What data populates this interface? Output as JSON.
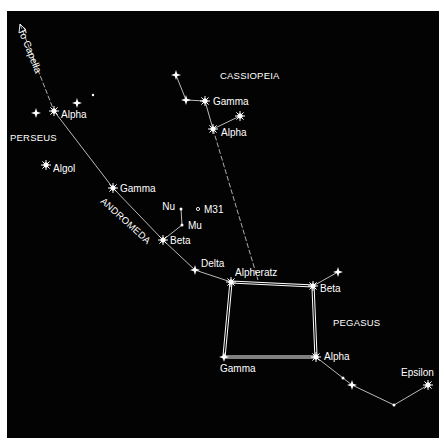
{
  "chart": {
    "background": "#030303",
    "line_color": "#e8e8e8",
    "label_color": "#ffffff",
    "constellations": [
      {
        "name": "CASSIOPEIA",
        "label_pos": [
          220,
          79
        ]
      },
      {
        "name": "PERSEUS",
        "label_pos": [
          10,
          141
        ]
      },
      {
        "name": "ANDROMEDA",
        "label_pos": [
          100,
          202
        ],
        "rotation": 42
      },
      {
        "name": "PEGASUS",
        "label_pos": [
          333,
          326
        ]
      }
    ],
    "pointer": {
      "label": "To Capella",
      "arrow": "arrow-up-left"
    },
    "stars": {
      "perseus_alpha": {
        "label": "Alpha",
        "x": 54,
        "y": 111
      },
      "perseus_algol": {
        "label": "Algol",
        "x": 46,
        "y": 165
      },
      "andromeda_gamma": {
        "label": "Gamma",
        "x": 113,
        "y": 188
      },
      "andromeda_beta": {
        "label": "Beta",
        "x": 163,
        "y": 240
      },
      "andromeda_delta": {
        "label": "Delta",
        "x": 195,
        "y": 270
      },
      "andromeda_nu": {
        "label": "Nu",
        "x": 181,
        "y": 209
      },
      "andromeda_mu": {
        "label": "Mu",
        "x": 182,
        "y": 225
      },
      "m31": {
        "label": "M31",
        "x": 192,
        "y": 209
      },
      "cassiopeia_gamma": {
        "label": "Gamma",
        "x": 205,
        "y": 101
      },
      "cassiopeia_alpha": {
        "label": "Alpha",
        "x": 213,
        "y": 129
      },
      "alpheratz": {
        "label": "Alpheratz",
        "x": 231,
        "y": 282
      },
      "pegasus_beta": {
        "label": "Beta",
        "x": 313,
        "y": 286
      },
      "pegasus_alpha": {
        "label": "Alpha",
        "x": 316,
        "y": 357
      },
      "pegasus_gamma": {
        "label": "Gamma",
        "x": 224,
        "y": 357
      },
      "pegasus_epsilon": {
        "label": "Epsilon",
        "x": 428,
        "y": 385
      }
    }
  }
}
